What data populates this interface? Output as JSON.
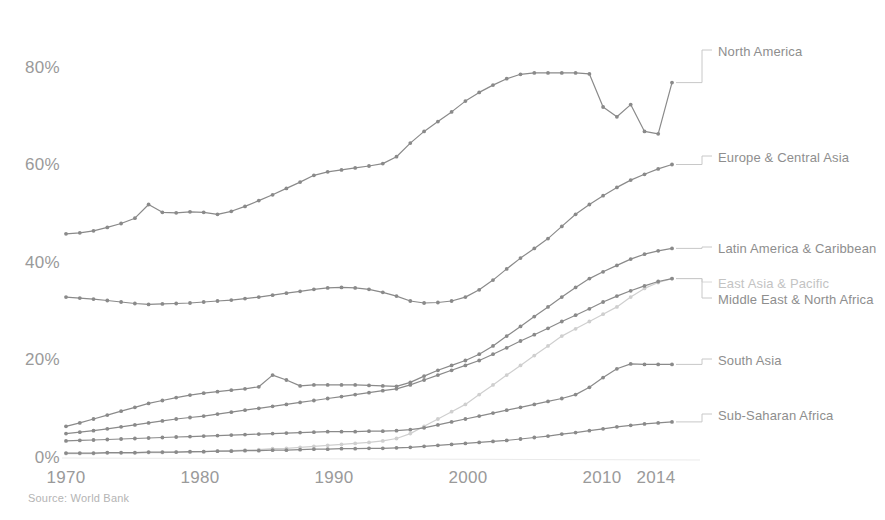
{
  "source_note": "Source: World Bank",
  "axes": {
    "y_ticks": [
      "0%",
      "20%",
      "40%",
      "60%",
      "80%"
    ],
    "x_ticks": [
      "1970",
      "1980",
      "1990",
      "2000",
      "2010",
      "2014"
    ]
  },
  "labels": {
    "north_america": "North America",
    "europe_central_asia": "Europe & Central Asia",
    "latin_america_caribbean": "Latin America & Caribbean",
    "east_asia_pacific": "East Asia & Pacific",
    "middle_east_north_africa": "Middle East & North Africa",
    "south_asia": "South Asia",
    "sub_saharan_africa": "Sub-Saharan Africa"
  },
  "chart_data": {
    "type": "line",
    "title": "",
    "xlabel": "",
    "ylabel": "",
    "xlim": [
      1970,
      2014
    ],
    "ylim": [
      0,
      100
    ],
    "grid": false,
    "legend_position": "right-inline",
    "x": [
      1970,
      1971,
      1972,
      1973,
      1974,
      1975,
      1976,
      1977,
      1978,
      1979,
      1980,
      1981,
      1982,
      1983,
      1984,
      1985,
      1986,
      1987,
      1988,
      1989,
      1990,
      1991,
      1992,
      1993,
      1994,
      1995,
      1996,
      1997,
      1998,
      1999,
      2000,
      2001,
      2002,
      2003,
      2004,
      2005,
      2006,
      2007,
      2008,
      2009,
      2010,
      2011,
      2012,
      2013,
      2014
    ],
    "series": [
      {
        "name": "North America",
        "color": "#8a8a8a",
        "values": [
          46.0,
          46.2,
          46.6,
          47.3,
          48.1,
          49.2,
          52.0,
          50.4,
          50.3,
          50.5,
          50.4,
          50.0,
          50.6,
          51.6,
          52.8,
          54.0,
          55.3,
          56.6,
          58.0,
          58.7,
          59.1,
          59.5,
          59.9,
          60.4,
          61.8,
          64.6,
          67.0,
          69.0,
          71.0,
          73.2,
          75.0,
          76.5,
          77.8,
          78.7,
          79.0,
          79.0,
          79.0,
          79.0,
          78.8,
          72.0,
          70.0,
          72.5,
          67.0,
          66.5,
          77.0
        ]
      },
      {
        "name": "Europe & Central Asia",
        "color": "#8a8a8a",
        "values": [
          33.0,
          32.8,
          32.6,
          32.3,
          32.0,
          31.7,
          31.5,
          31.6,
          31.7,
          31.8,
          32.0,
          32.2,
          32.4,
          32.7,
          33.0,
          33.4,
          33.8,
          34.2,
          34.6,
          34.9,
          35.0,
          34.9,
          34.6,
          34.0,
          33.2,
          32.2,
          31.8,
          31.9,
          32.2,
          33.0,
          34.5,
          36.5,
          38.8,
          41.0,
          43.0,
          45.0,
          47.5,
          50.0,
          52.0,
          53.8,
          55.5,
          57.0,
          58.2,
          59.3,
          60.2
        ]
      },
      {
        "name": "Latin America & Caribbean",
        "color": "#8a8a8a",
        "values": [
          6.5,
          7.2,
          8.0,
          8.8,
          9.6,
          10.4,
          11.2,
          11.8,
          12.4,
          12.9,
          13.3,
          13.6,
          13.9,
          14.2,
          14.6,
          17.0,
          16.0,
          14.8,
          15.0,
          15.0,
          15.0,
          15.0,
          14.9,
          14.8,
          14.7,
          15.5,
          16.8,
          18.0,
          19.0,
          20.0,
          21.3,
          23.0,
          25.0,
          27.0,
          29.0,
          31.0,
          33.0,
          35.0,
          36.8,
          38.2,
          39.5,
          40.8,
          41.8,
          42.5,
          43.0
        ]
      },
      {
        "name": "East Asia & Pacific",
        "color": "#cfcfcf",
        "values": [
          0.9,
          0.9,
          0.9,
          1.0,
          1.0,
          1.0,
          1.1,
          1.1,
          1.2,
          1.2,
          1.3,
          1.4,
          1.5,
          1.6,
          1.7,
          1.9,
          2.0,
          2.2,
          2.4,
          2.6,
          2.8,
          3.0,
          3.2,
          3.5,
          4.0,
          5.0,
          6.5,
          8.0,
          9.5,
          11.0,
          13.0,
          15.0,
          17.0,
          19.0,
          21.0,
          23.0,
          25.0,
          26.5,
          28.0,
          29.5,
          31.0,
          33.0,
          34.8,
          36.0,
          36.8
        ]
      },
      {
        "name": "Middle East & North Africa",
        "color": "#8a8a8a",
        "values": [
          5.0,
          5.3,
          5.6,
          6.0,
          6.4,
          6.8,
          7.2,
          7.6,
          8.0,
          8.3,
          8.6,
          9.0,
          9.4,
          9.8,
          10.2,
          10.6,
          11.0,
          11.4,
          11.8,
          12.2,
          12.6,
          13.0,
          13.4,
          13.8,
          14.2,
          15.0,
          16.0,
          17.0,
          18.0,
          19.0,
          20.0,
          21.3,
          22.6,
          24.0,
          25.3,
          26.6,
          28.0,
          29.3,
          30.6,
          32.0,
          33.2,
          34.3,
          35.3,
          36.2,
          36.8
        ]
      },
      {
        "name": "South Asia",
        "color": "#8a8a8a",
        "values": [
          3.5,
          3.6,
          3.7,
          3.8,
          3.9,
          4.0,
          4.1,
          4.2,
          4.3,
          4.4,
          4.5,
          4.6,
          4.7,
          4.8,
          4.9,
          5.0,
          5.1,
          5.2,
          5.3,
          5.4,
          5.4,
          5.4,
          5.5,
          5.5,
          5.6,
          5.8,
          6.2,
          6.8,
          7.4,
          8.0,
          8.6,
          9.2,
          9.8,
          10.4,
          11.0,
          11.6,
          12.2,
          13.0,
          14.5,
          16.5,
          18.3,
          19.3,
          19.2,
          19.2,
          19.2
        ]
      },
      {
        "name": "Sub-Saharan Africa",
        "color": "#8a8a8a",
        "values": [
          1.0,
          1.0,
          1.0,
          1.1,
          1.1,
          1.1,
          1.2,
          1.2,
          1.2,
          1.3,
          1.3,
          1.4,
          1.4,
          1.5,
          1.5,
          1.6,
          1.6,
          1.7,
          1.8,
          1.8,
          1.9,
          1.9,
          2.0,
          2.0,
          2.1,
          2.2,
          2.4,
          2.6,
          2.8,
          3.0,
          3.2,
          3.4,
          3.6,
          3.9,
          4.2,
          4.5,
          4.9,
          5.2,
          5.6,
          6.0,
          6.4,
          6.7,
          7.0,
          7.2,
          7.4
        ]
      }
    ]
  }
}
